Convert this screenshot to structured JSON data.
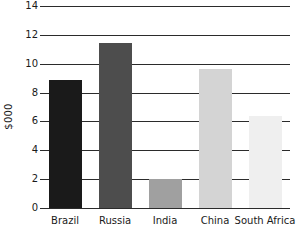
{
  "chart_data": {
    "type": "bar",
    "title": "",
    "subtitle": "",
    "xlabel": "",
    "ylabel": "$000",
    "categories": [
      "Brazil",
      "Russia",
      "India",
      "China",
      "South Africa"
    ],
    "values": [
      8.9,
      11.45,
      2.0,
      9.65,
      6.4
    ],
    "series": [
      {
        "name": "",
        "values": [
          8.9,
          11.45,
          2.0,
          9.65,
          6.4
        ]
      }
    ],
    "bar_colors": [
      "#1a1a1a",
      "#4d4d4d",
      "#a0a0a0",
      "#d4d4d4",
      "#efefef"
    ],
    "ylim": [
      0,
      14
    ],
    "yticks": [
      0,
      2,
      4,
      6,
      8,
      10,
      12,
      14
    ],
    "ytick_labels": [
      "0",
      "2",
      "4",
      "6",
      "8",
      "10",
      "12",
      "14"
    ],
    "grid": true,
    "grid_axis": "y",
    "legend": false,
    "legend_position": "none",
    "axis_color": "#2b2b2b",
    "background_color": "#ffffff",
    "text_color": "#1a1a1a"
  }
}
